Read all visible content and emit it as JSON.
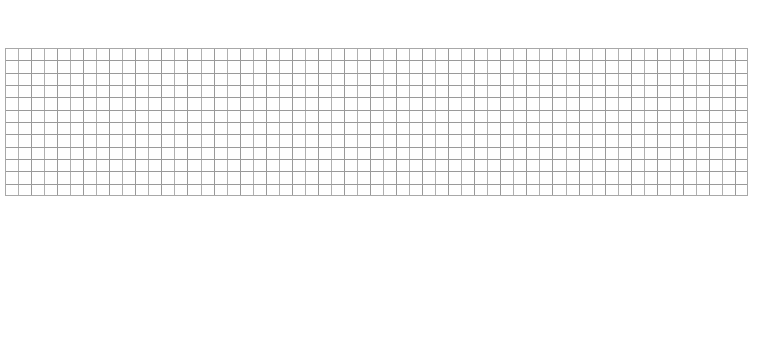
{
  "canvas": {
    "width": 765,
    "height": 348,
    "background_color": "#ffffff"
  },
  "grid": {
    "name": "graph-paper-grid",
    "origin_x": 5,
    "origin_y": 48,
    "width": 743,
    "height": 148,
    "columns": 57,
    "rows": 12,
    "cell_width": 13.035,
    "cell_height": 12.333,
    "line_color": "#b0b0b0",
    "line_color_alt": "#9a9a9a",
    "line_width": 1,
    "border_color": "#a8a8a8",
    "fill_color": "#ffffff"
  },
  "chart_data": {
    "type": "table",
    "title": "",
    "subtitle": "",
    "xlabel": "",
    "ylabel": "",
    "columns": 57,
    "rows": 12,
    "categories": [],
    "values": [],
    "tick_labels_x": [],
    "tick_labels_y": [],
    "legend": [],
    "annotations": [],
    "grid": "on",
    "legend_position": "none",
    "xlim": [
      0,
      57
    ],
    "ylim": [
      0,
      12
    ]
  },
  "regions": {
    "top_blank_label": "",
    "bottom_blank_label": ""
  }
}
